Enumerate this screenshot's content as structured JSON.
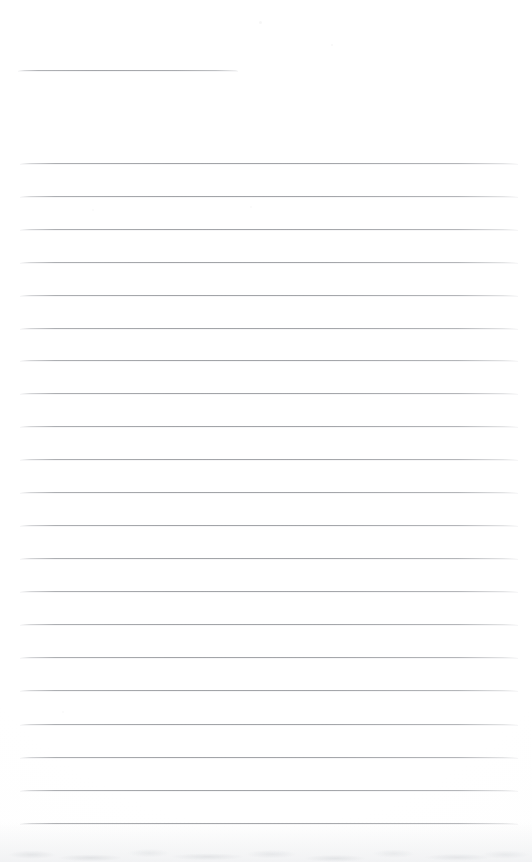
{
  "document": {
    "kind": "scanned-ruled-paper",
    "title": "",
    "body_text": "",
    "canvas": {
      "width": 532,
      "height": 862
    }
  },
  "colors": {
    "paper": "#fefefe",
    "rule": "#a4a6aa",
    "rule_faded": "#c8cace",
    "scan_edge": "#eef0f1"
  },
  "header_rule": {
    "label": "",
    "x": 18,
    "y": 70,
    "width": 220
  },
  "ruled_lines": {
    "count": 21,
    "start_x": 20,
    "end_x": 518,
    "first_y": 163,
    "spacing": 33,
    "lines": [
      {
        "index": 1,
        "y": 163,
        "x": 20,
        "width": 498,
        "text": ""
      },
      {
        "index": 2,
        "y": 196,
        "x": 20,
        "width": 498,
        "text": ""
      },
      {
        "index": 3,
        "y": 229,
        "x": 20,
        "width": 498,
        "text": ""
      },
      {
        "index": 4,
        "y": 262,
        "x": 20,
        "width": 498,
        "text": ""
      },
      {
        "index": 5,
        "y": 295,
        "x": 20,
        "width": 498,
        "text": ""
      },
      {
        "index": 6,
        "y": 328,
        "x": 20,
        "width": 498,
        "text": ""
      },
      {
        "index": 7,
        "y": 360,
        "x": 20,
        "width": 498,
        "text": ""
      },
      {
        "index": 8,
        "y": 393,
        "x": 20,
        "width": 498,
        "text": ""
      },
      {
        "index": 9,
        "y": 426,
        "x": 20,
        "width": 498,
        "text": ""
      },
      {
        "index": 10,
        "y": 459,
        "x": 20,
        "width": 498,
        "text": ""
      },
      {
        "index": 11,
        "y": 492,
        "x": 20,
        "width": 498,
        "text": ""
      },
      {
        "index": 12,
        "y": 525,
        "x": 20,
        "width": 498,
        "text": ""
      },
      {
        "index": 13,
        "y": 558,
        "x": 20,
        "width": 498,
        "text": ""
      },
      {
        "index": 14,
        "y": 591,
        "x": 20,
        "width": 498,
        "text": ""
      },
      {
        "index": 15,
        "y": 624,
        "x": 20,
        "width": 498,
        "text": ""
      },
      {
        "index": 16,
        "y": 657,
        "x": 20,
        "width": 498,
        "text": ""
      },
      {
        "index": 17,
        "y": 690,
        "x": 20,
        "width": 498,
        "text": ""
      },
      {
        "index": 18,
        "y": 724,
        "x": 20,
        "width": 498,
        "text": ""
      },
      {
        "index": 19,
        "y": 757,
        "x": 20,
        "width": 498,
        "text": ""
      },
      {
        "index": 20,
        "y": 790,
        "x": 20,
        "width": 498,
        "text": ""
      },
      {
        "index": 21,
        "y": 823,
        "x": 20,
        "width": 498,
        "text": ""
      }
    ]
  },
  "specks": [
    {
      "x": 259,
      "y": 21,
      "size": 3,
      "opacity": 0.1
    },
    {
      "x": 331,
      "y": 44,
      "size": 2,
      "opacity": 0.08
    },
    {
      "x": 92,
      "y": 209,
      "size": 2,
      "opacity": 0.07
    },
    {
      "x": 250,
      "y": 206,
      "size": 2,
      "opacity": 0.06
    },
    {
      "x": 62,
      "y": 711,
      "size": 2,
      "opacity": 0.07
    }
  ]
}
